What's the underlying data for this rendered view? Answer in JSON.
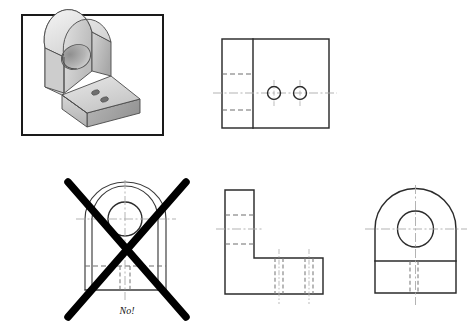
{
  "figure": {
    "annotation_label": "No!",
    "colors": {
      "object_line": "#2b2b2b",
      "hidden_line": "#6e6e6e",
      "center_line": "#aaaaaa",
      "cross_mark": "#000000",
      "frame_border": "#1a1a1a",
      "shading_light": "#f0f0f0",
      "shading_mid": "#c9c9c9",
      "shading_dark": "#9a9a9a",
      "background": "#ffffff"
    }
  },
  "views": {
    "pictorial": {
      "name": "isometric-pictorial-view",
      "description": "Isometric shaded pictorial of L-shaped bracket with rounded upright and through hole, base with two small holes",
      "frame": {
        "x": 22,
        "y": 15,
        "width": 141,
        "height": 120
      }
    },
    "top": {
      "name": "top-view",
      "description": "Top view: rectangle with vertical division, two holes with center marks, hidden lines at left",
      "outline": {
        "x": 222,
        "y": 39,
        "width": 107,
        "height": 89
      },
      "division_x": 253,
      "holes": [
        {
          "cx": 274,
          "cy": 93,
          "r": 6.5
        },
        {
          "cx": 300,
          "cy": 93,
          "r": 6.5
        }
      ],
      "hidden_lines_y": [
        74,
        110
      ]
    },
    "front_incorrect": {
      "name": "front-view-incorrect",
      "description": "Incorrect front view: arch narrower than body, crossed out with a large X",
      "rect": {
        "x": 85,
        "y": 219,
        "width": 81,
        "height": 71
      },
      "arch": {
        "cx": 125,
        "cy": 219,
        "rx": 33,
        "ry": 33
      },
      "hole": {
        "cx": 125,
        "cy": 219,
        "r": 17
      },
      "horizontal_line_y": 266,
      "cross": {
        "stroke1": {
          "x1": 68,
          "y1": 182,
          "x2": 186,
          "y2": 317
        },
        "stroke2": {
          "x1": 186,
          "y1": 182,
          "x2": 68,
          "y2": 317
        }
      }
    },
    "side": {
      "name": "right-side-view",
      "description": "Right side view: L-shape profile with hidden lines for holes",
      "vertical_leg": {
        "x": 225,
        "y": 190,
        "width": 29,
        "height": 90
      },
      "horizontal_leg": {
        "x": 225,
        "y": 258,
        "width": 98,
        "height": 36
      },
      "hidden_lines_y": [
        215,
        244
      ],
      "hidden_pairs_x": [
        [
          275,
          282
        ],
        [
          305,
          312
        ]
      ]
    },
    "front_correct": {
      "name": "front-view-correct",
      "description": "Correct front view: full-width semicircular top with hole, horizontal break line, hidden lines below",
      "rect": {
        "x": 375,
        "y": 229,
        "width": 81,
        "height": 64
      },
      "arc": {
        "cx": 415.5,
        "cy": 229,
        "r": 40.5
      },
      "hole": {
        "cx": 415.5,
        "cy": 229,
        "r": 18
      },
      "horizontal_line_y": 261,
      "hidden_pairs_x": [
        410,
        418
      ]
    }
  }
}
